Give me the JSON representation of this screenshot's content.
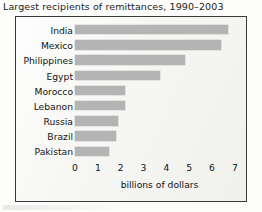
{
  "chart_data": {
    "type": "bar",
    "orientation": "horizontal",
    "title": "Largest recipients of remittances, 1990–2003",
    "xlabel": "billions of dollars",
    "ylabel": "",
    "categories": [
      "India",
      "Mexico",
      "Philippines",
      "Egypt",
      "Morocco",
      "Lebanon",
      "Russia",
      "Brazil",
      "Pakistan"
    ],
    "values": [
      6.7,
      6.4,
      4.8,
      3.7,
      2.2,
      2.2,
      1.9,
      1.8,
      1.5
    ],
    "xlim": [
      0,
      7.4
    ],
    "xticks": [
      0,
      1,
      2,
      3,
      4,
      5,
      6,
      7
    ],
    "xtick_labels": [
      "0",
      "1",
      "2",
      "3",
      "4",
      "5",
      "6",
      "7"
    ],
    "grid": false,
    "legend": false,
    "bar_color": "#b4b4b4",
    "border_color": "#3a3a3a",
    "background_color": "#f6f6f4",
    "text_color": "#121212"
  }
}
